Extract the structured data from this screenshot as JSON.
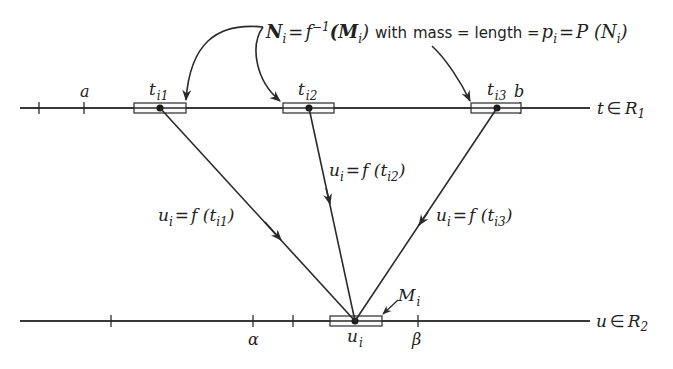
{
  "diagram": {
    "top_axis": {
      "label_var": "t",
      "label_set": "R",
      "label_set_sub": "1",
      "element_symbol": "∈",
      "tick_labels": {
        "a": "a",
        "b": "b"
      },
      "points": [
        {
          "base": "t",
          "sub": "i1"
        },
        {
          "base": "t",
          "sub": "i2"
        },
        {
          "base": "t",
          "sub": "i3"
        }
      ]
    },
    "bottom_axis": {
      "label_var": "u",
      "label_set": "R",
      "label_set_sub": "2",
      "element_symbol": "∈",
      "tick_labels": {
        "alpha": "α",
        "beta": "β"
      },
      "point": {
        "base": "u",
        "sub": "i"
      },
      "interval_label": {
        "base": "M",
        "sub": "i"
      }
    },
    "header_formula": {
      "N": "N",
      "N_sub": "i",
      "eq1": "=",
      "f": "f",
      "f_sup": "−1",
      "M_open": "(M",
      "M_sub": "i",
      "M_close": ")",
      "with": "with",
      "mass_length": "mass = length =",
      "p": "p",
      "p_sub": "i",
      "eq2": "=",
      "P": "P (N",
      "P_sub": "i",
      "P_close": ")"
    },
    "edges": [
      {
        "lhs": "u",
        "lhs_sub": "i",
        "eq": "=",
        "f": "f (t",
        "arg_sub": "i1",
        "close": ")"
      },
      {
        "lhs": "u",
        "lhs_sub": "i",
        "eq": "=",
        "f": "f (t",
        "arg_sub": "i2",
        "close": ")"
      },
      {
        "lhs": "u",
        "lhs_sub": "i",
        "eq": "=",
        "f": "f (t",
        "arg_sub": "i3",
        "close": ")"
      }
    ]
  }
}
